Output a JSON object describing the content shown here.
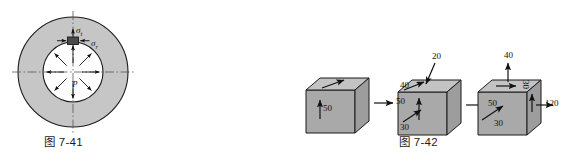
{
  "figure_left": {
    "caption": "图 7-41",
    "type": "thick-walled cylinder cross-section",
    "labels": {
      "hoop_stress": "σ",
      "hoop_stress_sub": "t",
      "radial_stress": "σ",
      "radial_stress_sub": "r",
      "internal_pressure": "p"
    },
    "colors": {
      "ring_fill": "#c6c6c6",
      "bore_fill": "#ffffff",
      "outline": "#1a1a1a",
      "centerline": "#555555",
      "element_fill": "#4a4a4a"
    },
    "geometry": {
      "center_x": 73,
      "center_y": 72,
      "outer_radius": 55,
      "inner_radius": 30,
      "pressure_arrow_count": 8
    }
  },
  "figure_right": {
    "caption": "图 7-42",
    "type": "stress element cubes",
    "colors": {
      "face_front": "#a9a9a9",
      "face_right": "#9d9d9d",
      "face_top": "#c3c3c3",
      "outline": "#1a1a1a"
    },
    "cubes": [
      {
        "name": "cube-a",
        "labels": [
          {
            "id": "front-shear",
            "text": "50"
          },
          {
            "id": "right-normal",
            "text": "50"
          }
        ]
      },
      {
        "name": "cube-b",
        "labels": [
          {
            "id": "top-normal",
            "text": "20"
          },
          {
            "id": "top-left",
            "text": "40"
          },
          {
            "id": "front-shear",
            "text": "30"
          },
          {
            "id": "right-normal",
            "text": "50"
          }
        ]
      },
      {
        "name": "cube-c",
        "labels": [
          {
            "id": "top-normal",
            "text": "40"
          },
          {
            "id": "right-edge",
            "text": "30"
          },
          {
            "id": "front-shear",
            "text": "30"
          },
          {
            "id": "right-normal",
            "text": "120"
          }
        ]
      }
    ]
  }
}
